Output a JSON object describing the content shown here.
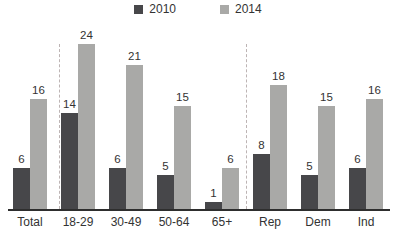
{
  "chart_data": {
    "type": "bar",
    "title": "",
    "categories": [
      "Total",
      "18-29",
      "30-49",
      "50-64",
      "65+",
      "Rep",
      "Dem",
      "Ind"
    ],
    "series": [
      {
        "name": "2010",
        "color": "#47474a",
        "values": [
          6,
          14,
          6,
          5,
          1,
          8,
          5,
          6
        ]
      },
      {
        "name": "2014",
        "color": "#a9a9a7",
        "values": [
          16,
          24,
          21,
          15,
          6,
          18,
          15,
          16
        ]
      }
    ],
    "ylim": [
      0,
      24
    ],
    "grid": false,
    "value_labels": true,
    "legend_position": "top-center",
    "separators_after_categories": [
      "Total",
      "65+"
    ],
    "axis_color": "#2e2e2e",
    "text_color": "#333333",
    "background_color": "#ffffff"
  }
}
